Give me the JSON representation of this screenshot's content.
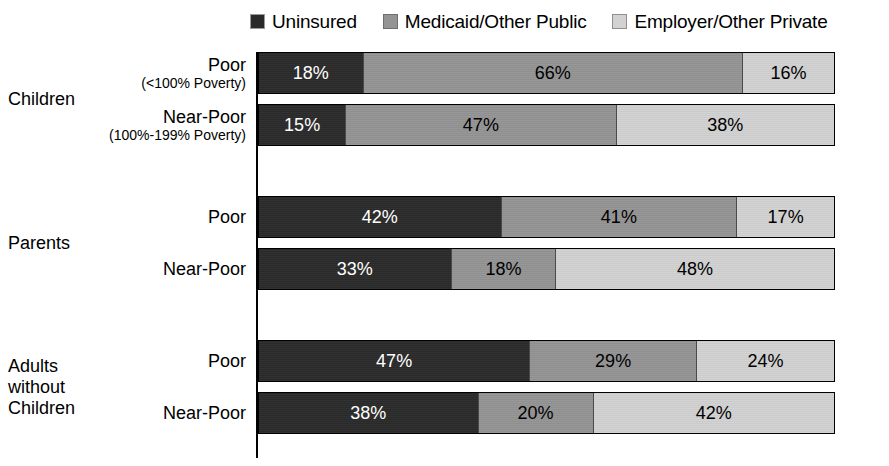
{
  "legend": {
    "items": [
      {
        "label": "Uninsured",
        "swatch": "sw-dark",
        "color": "#2a2a2a"
      },
      {
        "label": "Medicaid/Other Public",
        "swatch": "sw-medium",
        "color": "#949494"
      },
      {
        "label": "Employer/Other Private",
        "swatch": "sw-light",
        "color": "#d2d2d2"
      }
    ]
  },
  "chart_data": {
    "type": "bar",
    "orientation": "horizontal",
    "stacked": true,
    "normalized": true,
    "title": "",
    "xlabel": "",
    "ylabel": "",
    "xlim": [
      0,
      100
    ],
    "grid": false,
    "legend_position": "top",
    "legend": [
      "Uninsured",
      "Medicaid/Other Public",
      "Employer/Other Private"
    ],
    "series_colors": [
      "#2a2a2a",
      "#949494",
      "#d2d2d2"
    ],
    "groups": [
      {
        "name": "Children",
        "rows": [
          {
            "label": "Poor",
            "sublabel": "(<100% Poverty)",
            "values": [
              18,
              66,
              16
            ],
            "value_labels": [
              "18%",
              "66%",
              "16%"
            ]
          },
          {
            "label": "Near-Poor",
            "sublabel": "(100%-199% Poverty)",
            "values": [
              15,
              47,
              38
            ],
            "value_labels": [
              "15%",
              "47%",
              "38%"
            ]
          }
        ]
      },
      {
        "name": "Parents",
        "rows": [
          {
            "label": "Poor",
            "sublabel": "",
            "values": [
              42,
              41,
              17
            ],
            "value_labels": [
              "42%",
              "41%",
              "17%"
            ]
          },
          {
            "label": "Near-Poor",
            "sublabel": "",
            "values": [
              33,
              18,
              48
            ],
            "value_labels": [
              "33%",
              "18%",
              "48%"
            ]
          }
        ]
      },
      {
        "name": "Adults without Children",
        "name_lines": [
          "Adults",
          "without",
          "Children"
        ],
        "rows": [
          {
            "label": "Poor",
            "sublabel": "",
            "values": [
              47,
              29,
              24
            ],
            "value_labels": [
              "47%",
              "29%",
              "24%"
            ]
          },
          {
            "label": "Near-Poor",
            "sublabel": "",
            "values": [
              38,
              20,
              42
            ],
            "value_labels": [
              "38%",
              "20%",
              "42%"
            ]
          }
        ]
      }
    ]
  }
}
